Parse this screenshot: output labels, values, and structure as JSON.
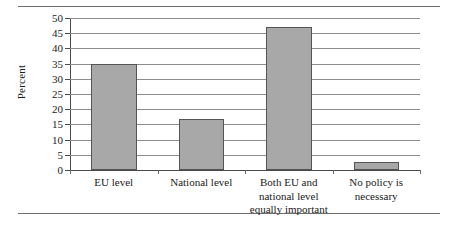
{
  "chart_data": {
    "type": "bar",
    "title": "",
    "subtitle": "",
    "xlabel": "",
    "ylabel": "Percent",
    "categories": [
      "EU level",
      "National level",
      "Both EU and\nnational level\nequally important",
      "No policy is\nnecessary"
    ],
    "values": [
      34.8,
      16.8,
      47.2,
      2.5
    ],
    "ylim": [
      0,
      50
    ],
    "ytick_labels": [
      "0",
      "5",
      "10",
      "15",
      "20",
      "25",
      "30",
      "35",
      "40",
      "45",
      "50"
    ],
    "ytick_values": [
      0,
      5,
      10,
      15,
      20,
      25,
      30,
      35,
      40,
      45,
      50
    ],
    "grid": true,
    "legend": false,
    "bar_color": "#a8a8a8",
    "bar_edge_color": "#545454",
    "gridline_color": "#8d8d8d",
    "axis_color": "#4a4a4a",
    "rule_color": "#6d6d6d"
  }
}
